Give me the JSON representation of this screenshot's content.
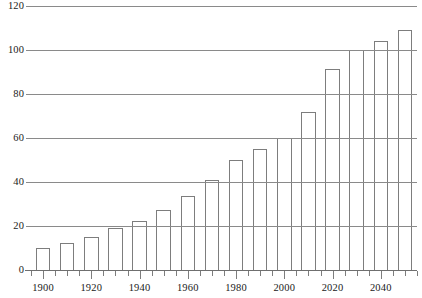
{
  "chart_data": {
    "type": "bar",
    "title": "",
    "subtitle": "",
    "xlabel": "",
    "ylabel": "",
    "categories": [
      1900,
      1910,
      1920,
      1930,
      1940,
      1950,
      1960,
      1970,
      1980,
      1990,
      2000,
      2010,
      2020,
      2030,
      2040,
      2050
    ],
    "values": [
      10,
      12.5,
      15,
      19,
      22.5,
      27.5,
      33.5,
      41,
      50,
      55,
      60,
      72,
      91.5,
      100,
      104,
      109
    ],
    "series": [
      {
        "name": "",
        "values": [
          10,
          12.5,
          15,
          19,
          22.5,
          27.5,
          33.5,
          41,
          50,
          55,
          60,
          72,
          91.5,
          100,
          104,
          109
        ]
      }
    ],
    "xlim": [
      1895,
      2055
    ],
    "ylim": [
      0,
      120
    ],
    "y_ticks": [
      0,
      20,
      40,
      60,
      80,
      100,
      120
    ],
    "y_tick_labels": [
      "0",
      "20",
      "40",
      "60",
      "80",
      "100",
      "120"
    ],
    "x_ticks_major": [
      1900,
      1920,
      1940,
      1960,
      1980,
      2000,
      2020,
      2040
    ],
    "x_tick_labels": [
      "1900",
      "1920",
      "1940",
      "1960",
      "1980",
      "2000",
      "2020",
      "2040"
    ],
    "x_minor_tick_step": 5,
    "bar_width_years": 6,
    "grid": "horizontal",
    "legend": "none",
    "bar_fill": "#ffffff",
    "bar_stroke": "#7d7d7d",
    "grid_color": "#8a8a8a",
    "text_color": "#1a1a1a"
  }
}
